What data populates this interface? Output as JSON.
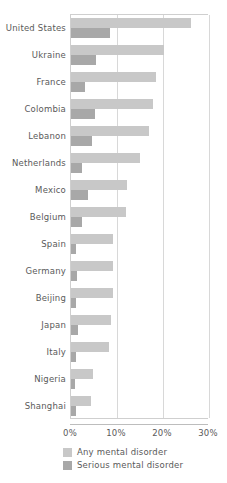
{
  "chart_data": {
    "type": "bar",
    "orientation": "horizontal",
    "title": "",
    "subtitle": "",
    "xlabel": "",
    "ylabel": "",
    "xlim": [
      0,
      30
    ],
    "xtick_labels": [
      "0%",
      "10%",
      "20%",
      "30%"
    ],
    "xtick_values": [
      0,
      10,
      20,
      30
    ],
    "grid": "vertical",
    "legend_position": "bottom-left",
    "categories": [
      "United States",
      "Ukraine",
      "France",
      "Colombia",
      "Lebanon",
      "Netherlands",
      "Mexico",
      "Belgium",
      "Spain",
      "Germany",
      "Beijing",
      "Japan",
      "Italy",
      "Nigeria",
      "Shanghai"
    ],
    "series": [
      {
        "name": "Any mental disorder",
        "color": "#c8c8c8",
        "values": [
          26.0,
          20.3,
          18.5,
          17.8,
          16.9,
          14.9,
          12.2,
          12.0,
          9.2,
          9.1,
          9.1,
          8.8,
          8.2,
          4.7,
          4.3
        ]
      },
      {
        "name": "Serious mental disorder",
        "color": "#a8a8a8",
        "values": [
          8.5,
          5.5,
          3.0,
          5.2,
          4.6,
          2.3,
          3.8,
          2.4,
          1.0,
          1.2,
          1.0,
          1.5,
          1.0,
          0.9,
          1.1
        ]
      }
    ]
  },
  "legend": {
    "items": [
      {
        "label": "Any mental disorder",
        "color": "#c8c8c8"
      },
      {
        "label": "Serious mental disorder",
        "color": "#a8a8a8"
      }
    ]
  },
  "colors": {
    "any_mental_disorder": "#c8c8c8",
    "serious_mental_disorder": "#a8a8a8",
    "gridline": "#d8d8d8",
    "axis": "#bdbdbd",
    "text": "#5a5a5a",
    "background": "#ffffff"
  }
}
